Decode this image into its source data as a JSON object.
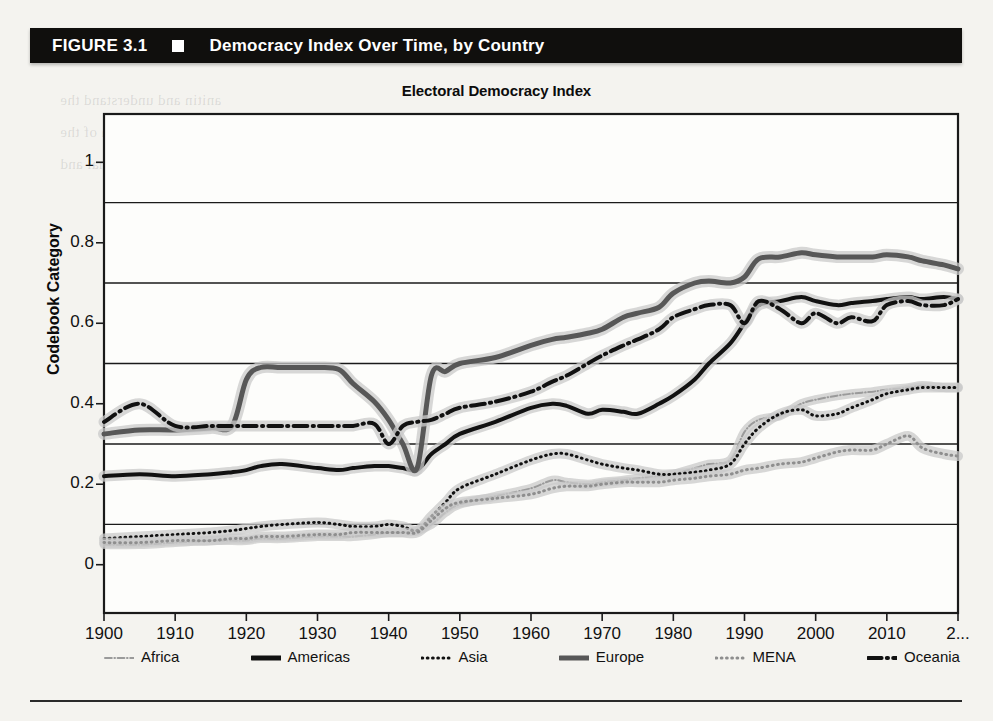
{
  "figure": {
    "number": "FIGURE 3.1",
    "marker": "black-square-bullet",
    "title": "Democracy Index Over Time, by Country"
  },
  "chart_data": {
    "type": "line",
    "title": "Electoral Democracy Index",
    "xlabel": "",
    "ylabel": "Codebook Category",
    "xlim": [
      1900,
      2020
    ],
    "ylim": [
      -0.12,
      1.12
    ],
    "grid": true,
    "gridlines_y": [
      0.1,
      0.3,
      0.5,
      0.7,
      0.9
    ],
    "xticks": [
      1900,
      1910,
      1920,
      1930,
      1940,
      1950,
      1960,
      1970,
      1980,
      1990,
      2000,
      2010,
      2020
    ],
    "xtick_labels": [
      "1900",
      "1910",
      "1920",
      "1930",
      "1940",
      "1950",
      "1960",
      "1970",
      "1980",
      "1990",
      "2000",
      "2010",
      "2..."
    ],
    "yticks": [
      0,
      0.2,
      0.4,
      0.6,
      0.8,
      1
    ],
    "ytick_labels": [
      "0",
      "0.2",
      "0.4",
      "0.6",
      "0.8",
      "1"
    ],
    "legend_position": "below-axis",
    "confidence_band": true,
    "x": [
      1900,
      1905,
      1910,
      1915,
      1918,
      1920,
      1922,
      1925,
      1930,
      1933,
      1935,
      1938,
      1940,
      1942,
      1944,
      1946,
      1948,
      1950,
      1955,
      1960,
      1963,
      1965,
      1968,
      1970,
      1973,
      1975,
      1978,
      1980,
      1983,
      1985,
      1988,
      1990,
      1992,
      1995,
      1998,
      2000,
      2003,
      2005,
      2008,
      2010,
      2013,
      2015,
      2018,
      2020
    ],
    "series": [
      {
        "name": "Africa",
        "style": "dash-dot",
        "color": "#9a9a9a",
        "width": 2,
        "values": [
          0.05,
          0.05,
          0.055,
          0.06,
          0.06,
          0.06,
          0.065,
          0.065,
          0.07,
          0.07,
          0.07,
          0.075,
          0.08,
          0.08,
          0.085,
          0.1,
          0.13,
          0.15,
          0.17,
          0.19,
          0.21,
          0.205,
          0.2,
          0.205,
          0.21,
          0.215,
          0.22,
          0.225,
          0.24,
          0.25,
          0.26,
          0.33,
          0.36,
          0.37,
          0.4,
          0.41,
          0.42,
          0.425,
          0.43,
          0.435,
          0.44,
          0.445,
          0.44,
          0.44
        ]
      },
      {
        "name": "Americas",
        "style": "solid",
        "color": "#111111",
        "width": 4,
        "values": [
          0.22,
          0.225,
          0.22,
          0.225,
          0.23,
          0.235,
          0.245,
          0.25,
          0.24,
          0.235,
          0.24,
          0.245,
          0.245,
          0.24,
          0.235,
          0.275,
          0.3,
          0.325,
          0.355,
          0.39,
          0.4,
          0.395,
          0.375,
          0.385,
          0.38,
          0.375,
          0.4,
          0.42,
          0.46,
          0.5,
          0.55,
          0.6,
          0.645,
          0.655,
          0.665,
          0.655,
          0.645,
          0.65,
          0.655,
          0.66,
          0.665,
          0.66,
          0.665,
          0.66
        ]
      },
      {
        "name": "Asia",
        "style": "dotted",
        "color": "#111111",
        "width": 3,
        "values": [
          0.065,
          0.07,
          0.075,
          0.08,
          0.085,
          0.09,
          0.095,
          0.1,
          0.105,
          0.1,
          0.095,
          0.095,
          0.1,
          0.095,
          0.085,
          0.12,
          0.155,
          0.19,
          0.225,
          0.26,
          0.275,
          0.275,
          0.26,
          0.25,
          0.24,
          0.235,
          0.225,
          0.225,
          0.23,
          0.235,
          0.25,
          0.3,
          0.34,
          0.375,
          0.385,
          0.37,
          0.375,
          0.39,
          0.41,
          0.425,
          0.435,
          0.44,
          0.44,
          0.44
        ]
      },
      {
        "name": "Europe",
        "style": "solid",
        "color": "#575757",
        "width": 5,
        "values": [
          0.325,
          0.335,
          0.335,
          0.34,
          0.345,
          0.46,
          0.49,
          0.49,
          0.49,
          0.485,
          0.45,
          0.405,
          0.36,
          0.3,
          0.24,
          0.47,
          0.48,
          0.5,
          0.515,
          0.545,
          0.56,
          0.565,
          0.575,
          0.585,
          0.615,
          0.625,
          0.64,
          0.675,
          0.7,
          0.705,
          0.7,
          0.715,
          0.76,
          0.765,
          0.775,
          0.77,
          0.765,
          0.765,
          0.765,
          0.77,
          0.765,
          0.755,
          0.745,
          0.735
        ]
      },
      {
        "name": "MENA",
        "style": "dotted",
        "color": "#8e8e8e",
        "width": 3,
        "values": [
          0.055,
          0.055,
          0.06,
          0.06,
          0.065,
          0.065,
          0.07,
          0.07,
          0.075,
          0.075,
          0.08,
          0.08,
          0.08,
          0.08,
          0.08,
          0.11,
          0.14,
          0.155,
          0.165,
          0.175,
          0.19,
          0.195,
          0.195,
          0.2,
          0.205,
          0.205,
          0.205,
          0.21,
          0.215,
          0.22,
          0.225,
          0.235,
          0.24,
          0.25,
          0.255,
          0.265,
          0.28,
          0.285,
          0.285,
          0.3,
          0.32,
          0.29,
          0.275,
          0.27
        ]
      },
      {
        "name": "Oceania",
        "style": "dash-dot",
        "color": "#111111",
        "width": 4,
        "values": [
          0.355,
          0.4,
          0.345,
          0.345,
          0.345,
          0.345,
          0.345,
          0.345,
          0.345,
          0.345,
          0.345,
          0.35,
          0.3,
          0.345,
          0.355,
          0.36,
          0.375,
          0.39,
          0.405,
          0.43,
          0.455,
          0.47,
          0.5,
          0.52,
          0.545,
          0.56,
          0.585,
          0.615,
          0.635,
          0.645,
          0.645,
          0.6,
          0.655,
          0.635,
          0.6,
          0.625,
          0.6,
          0.615,
          0.605,
          0.645,
          0.655,
          0.645,
          0.645,
          0.66
        ]
      }
    ]
  },
  "legend": {
    "items": [
      {
        "label": "Africa",
        "style": "dash-dot",
        "color": "#9a9a9a",
        "width": 2
      },
      {
        "label": "Americas",
        "style": "solid",
        "color": "#111111",
        "width": 5
      },
      {
        "label": "Asia",
        "style": "dotted",
        "color": "#111111",
        "width": 3
      },
      {
        "label": "Europe",
        "style": "solid",
        "color": "#575757",
        "width": 5
      },
      {
        "label": "MENA",
        "style": "dotted",
        "color": "#8e8e8e",
        "width": 3
      },
      {
        "label": "Oceania",
        "style": "dash-dot",
        "color": "#111111",
        "width": 4
      }
    ]
  },
  "ghost_text": [
    "anitin and understand the",
    "nedian partition of the",
    "of the deep internal and"
  ],
  "colors": {
    "header_bar": "#100f0d",
    "page_background": "#f4f3ef",
    "axis": "#1a1a1a",
    "band": "#c9c9c9"
  }
}
